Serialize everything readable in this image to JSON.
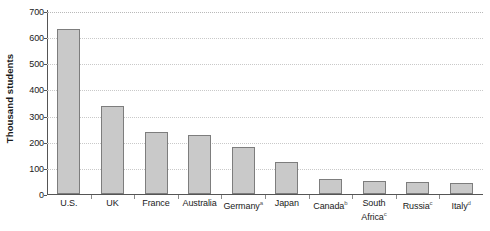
{
  "chart_data": {
    "type": "bar",
    "title": "",
    "xlabel": "",
    "ylabel": "Thousand students",
    "ylim": [
      0,
      700
    ],
    "ytick_values": [
      700,
      600,
      500,
      400,
      300,
      200,
      100,
      0
    ],
    "ytick_labels": [
      "700",
      "600",
      "500",
      "400",
      "300",
      "200",
      "100",
      "0"
    ],
    "grid": true,
    "grid_axis": "y",
    "legend": false,
    "bar_fill_color": "#c9c9c9",
    "bar_border_color": "#7d7d7d",
    "axis_color": "#555555",
    "gridline_color": "#b9b9b9",
    "categories": [
      "U.S.",
      "UK",
      "France",
      "Australia",
      "Germany",
      "Japan",
      "Canada",
      "South Africa",
      "Russia",
      "Italy"
    ],
    "category_notes": [
      "",
      "",
      "",
      "",
      "a",
      "",
      "b",
      "c",
      "c",
      "d"
    ],
    "values": [
      630,
      337,
      238,
      226,
      180,
      122,
      58,
      50,
      46,
      42
    ]
  }
}
